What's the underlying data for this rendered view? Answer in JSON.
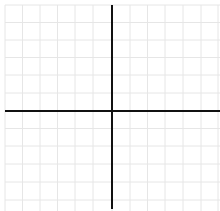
{
  "diagram": {
    "type": "cartesian-coordinate-grid",
    "width": 220,
    "height": 211,
    "grid": {
      "color": "#e6e6e6",
      "line_width": 1,
      "x_lines": [
        5,
        22.5,
        40,
        57.5,
        75,
        93,
        112,
        130,
        147.5,
        165,
        183,
        201,
        218
      ],
      "y_lines": [
        5,
        22.5,
        40,
        57.5,
        75,
        93,
        111,
        128.5,
        146,
        164,
        182,
        200
      ]
    },
    "axes": {
      "color": "#111111",
      "line_width": 2,
      "x_axis": {
        "y": 111,
        "x_start": 5,
        "x_end": 220
      },
      "y_axis": {
        "x": 112,
        "y_start": 5,
        "y_end": 209
      }
    },
    "labels": []
  }
}
